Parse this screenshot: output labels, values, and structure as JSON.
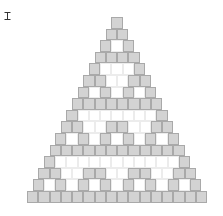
{
  "cursor": {
    "icon": "i-beam-cursor-icon"
  },
  "triangle": {
    "center_x": 117,
    "top_y": 17,
    "cell_width": 11.25,
    "cell_height": 11.6,
    "colors": {
      "filled": "#d3d3d3",
      "filled_border": "#a9a9a9",
      "empty": "#ffffff",
      "empty_border": "#ececec"
    },
    "rows": [
      "1",
      "11",
      "101",
      "1111",
      "10001",
      "110011",
      "1010101",
      "11111111",
      "100000001",
      "1100110011",
      "10101010101",
      "111111111111",
      "1000000000001",
      "11001100110011",
      "101010101010101",
      "1111111111111111"
    ]
  }
}
